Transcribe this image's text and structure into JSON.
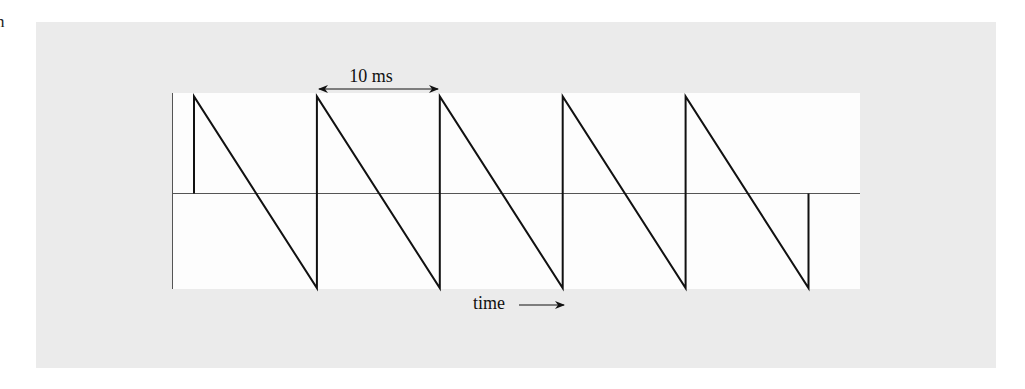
{
  "page": {
    "stray_text": "n"
  },
  "figure": {
    "period_label": "10 ms",
    "time_label": "time",
    "colors": {
      "panel": "#ebebeb",
      "plot": "#fdfdfd",
      "line": "#111111",
      "axis": "#444444"
    }
  },
  "chart_data": {
    "type": "line",
    "title": "",
    "xlabel": "time",
    "ylabel": "",
    "period_ms": 10,
    "annotations": [
      {
        "text": "10 ms",
        "kind": "double-arrow",
        "from_x_ms": 10,
        "to_x_ms": 20
      },
      {
        "text": "time",
        "kind": "arrow-right"
      }
    ],
    "x_ms": [
      0,
      0,
      10,
      10,
      20,
      20,
      30,
      30,
      40,
      40,
      50,
      50
    ],
    "y": [
      0,
      1,
      -1,
      1,
      -1,
      1,
      -1,
      1,
      -1,
      1,
      -1,
      0
    ],
    "xlim": [
      -1.8,
      54.1
    ],
    "ylim": [
      -1,
      1
    ],
    "grid": false,
    "legend": null
  }
}
